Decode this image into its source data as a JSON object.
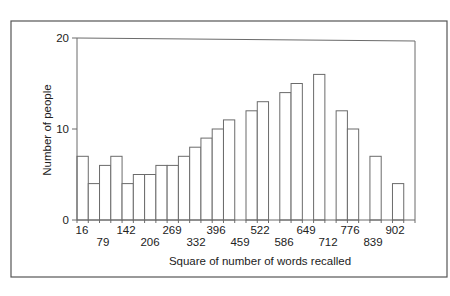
{
  "chart_data": {
    "type": "bar",
    "subtype": "histogram",
    "title": "",
    "xlabel": "Square of number of words recalled",
    "ylabel": "Number of people",
    "ylim": [
      0,
      20
    ],
    "yticks": [
      0,
      10,
      20
    ],
    "grid": false,
    "legend": null,
    "xtick_labels": [
      "16",
      "79",
      "142",
      "206",
      "269",
      "332",
      "396",
      "459",
      "522",
      "586",
      "649",
      "712",
      "776",
      "839",
      "902"
    ],
    "bin_count": 30,
    "values": [
      7,
      4,
      6,
      7,
      4,
      5,
      5,
      6,
      6,
      7,
      8,
      9,
      10,
      11,
      0,
      12,
      13,
      0,
      14,
      15,
      0,
      16,
      0,
      12,
      10,
      0,
      7,
      0,
      4,
      0
    ]
  },
  "colors": {
    "axis": "#6b6b6b",
    "bar_stroke": "#6b6b6b",
    "bar_fill": "#ffffff",
    "frame": "#555555",
    "text": "#222222"
  },
  "layout": {
    "frame": {
      "x": 11,
      "y": 21,
      "w": 436,
      "h": 256
    },
    "plot": {
      "x0": 77,
      "x1": 415,
      "y_top": 38,
      "y_zero": 220
    },
    "xtick_label_x": [
      82,
      103,
      126,
      150,
      172,
      196,
      216,
      240,
      260,
      284,
      306,
      328,
      350,
      373,
      395
    ],
    "xtick_label_row": [
      0,
      1,
      0,
      1,
      0,
      1,
      0,
      1,
      0,
      1,
      0,
      1,
      0,
      1,
      0
    ]
  }
}
